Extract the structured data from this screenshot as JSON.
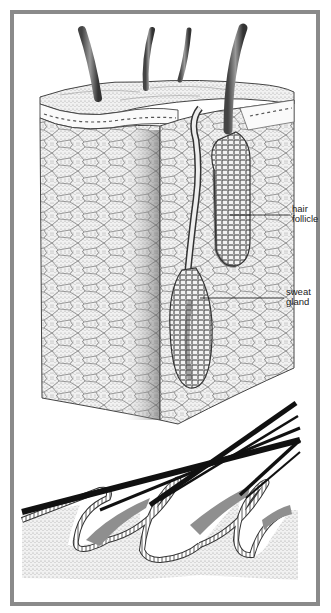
{
  "figure": {
    "type": "anatomical illustration",
    "panels": [
      {
        "name": "skin-block-cross-section",
        "description": "3D block of skin with hair shafts, hair follicle and sweat gland"
      },
      {
        "name": "hair-follicle-longitudinal-section",
        "description": "Hairs emerging obliquely from follicles in skin"
      }
    ],
    "labels": {
      "hair_follicle_line1": "hair",
      "hair_follicle_line2": "follicle",
      "sweat_gland_line1": "sweat",
      "sweat_gland_line2": "gland"
    },
    "colors": {
      "frame": "#8a8a8a",
      "background": "#ffffff",
      "ink": "#1a1a1a",
      "stipple": "#bdbdbd",
      "sheath_gray": "#8f8f8f"
    }
  }
}
